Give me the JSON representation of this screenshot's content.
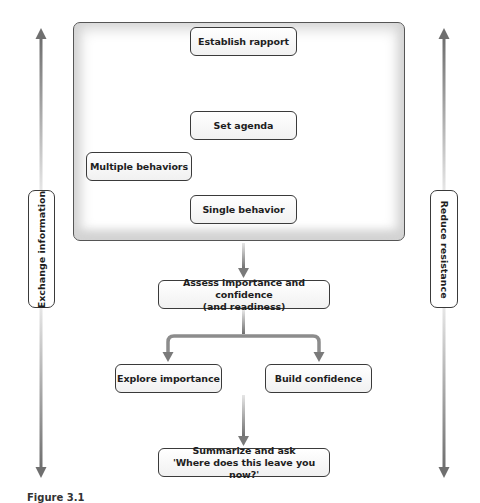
{
  "diagram": {
    "type": "flowchart",
    "side_labels": {
      "left": "Exchange information",
      "right": "Reduce resistance"
    },
    "nodes": {
      "establish_rapport": "Establish rapport",
      "set_agenda": "Set agenda",
      "multiple_behaviors": "Multiple behaviors",
      "single_behavior": "Single behavior",
      "assess": "Assess importance and confidence (and readiness)",
      "assess_line1": "Assess importance and confidence",
      "assess_line2": "(and readiness)",
      "explore_importance": "Explore importance",
      "build_confidence": "Build confidence",
      "summarize_line1": "Summarize and ask",
      "summarize_line2": "'Where does this leave you now?'"
    },
    "edges": [
      {
        "from": "Establish rapport",
        "to": "Set agenda"
      },
      {
        "from": "Set agenda",
        "to": "Multiple behaviors"
      },
      {
        "from": "Set agenda",
        "to": "Single behavior"
      },
      {
        "from": "Multiple behaviors",
        "to": "Single behavior"
      },
      {
        "from": "Single behavior",
        "to": "Assess importance and confidence (and readiness)"
      },
      {
        "from": "Assess importance and confidence (and readiness)",
        "to": "Explore importance"
      },
      {
        "from": "Assess importance and confidence (and readiness)",
        "to": "Build confidence"
      },
      {
        "from": "Explore importance / Build confidence",
        "to": "Summarize and ask 'Where does this leave you now?'"
      }
    ],
    "colors": {
      "arrow": "#7a7a7a",
      "border": "#3a3a3a",
      "frame_shadow": "#d4d4d4"
    },
    "caption": "Figure 3.1"
  }
}
